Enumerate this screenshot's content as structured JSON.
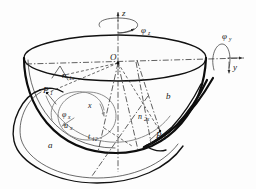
{
  "figure": {
    "caption": "",
    "background_color": "#fdfdfd",
    "ink_color": "#111111",
    "gray_color": "#8d8d8d",
    "width": 256,
    "height": 189
  },
  "axes": {
    "z_label": "z",
    "y_label": "y"
  },
  "rotations": {
    "phi_z": "φ",
    "phi_z_sub": "z",
    "phi_y": "φ",
    "phi_y_sub": "y",
    "phi_x": "φ",
    "phi_x_sub": "x"
  },
  "points": {
    "origin": "O",
    "p1": "P",
    "p1_sub": "1",
    "p2": "P",
    "p2_sub": "2"
  },
  "vectors": {
    "n1x": "n",
    "n1x_sub": "1x",
    "n2x": "n",
    "n2x_sub": "2x",
    "t12": "t",
    "t12_sub": "12",
    "ux": "u",
    "ux_sub": "x"
  },
  "bodies": {
    "a": "a",
    "b": "b"
  }
}
